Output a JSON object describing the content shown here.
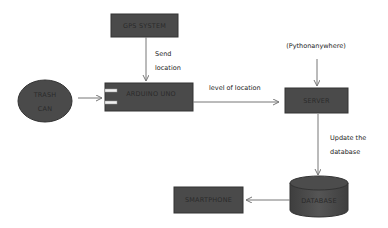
{
  "colors": {
    "node_fill": "#4a4a4a",
    "node_stroke": "#333333",
    "arrow": "#777777",
    "label_text": "#2a2a2a"
  },
  "nodes": {
    "gps": {
      "label": "GPS SYSTEM",
      "shape": "rectangle"
    },
    "trash": {
      "label_line1": "TRASH",
      "label_line2": "CAN",
      "shape": "ellipse"
    },
    "arduino": {
      "label": "ARDUINO UNO",
      "shape": "rectangle-with-pins"
    },
    "server": {
      "label": "SERVER",
      "shape": "rectangle"
    },
    "python": {
      "label": "(Pythonanywhere)",
      "shape": "text"
    },
    "database": {
      "label": "DATABASE",
      "shape": "cylinder"
    },
    "smartphone": {
      "label": "SMARTPHONE",
      "shape": "rectangle"
    }
  },
  "edges": {
    "gps_to_arduino": {
      "label_line1": "Send",
      "label_line2": "location"
    },
    "trash_to_arduino": {
      "label": ""
    },
    "arduino_to_server": {
      "label": "level of location"
    },
    "python_to_server": {
      "label": ""
    },
    "server_to_database": {
      "label_line1": "Update the",
      "label_line2": "database"
    },
    "database_to_smartphone": {
      "label": ""
    }
  }
}
